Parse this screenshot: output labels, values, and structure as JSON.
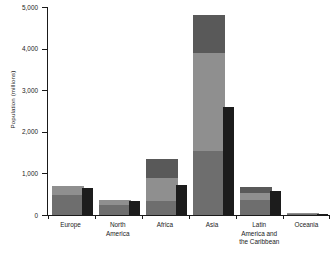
{
  "chart_data": {
    "type": "bar",
    "title": "",
    "subtitle": "",
    "xlabel": "",
    "ylabel": "Population (millions)",
    "ylim": [
      0,
      5000
    ],
    "ytick_values": [
      0,
      1000,
      2000,
      3000,
      4000,
      5000
    ],
    "ytick_labels": [
      "0",
      "1,000",
      "2,000",
      "3,000",
      "4,000",
      "5,000"
    ],
    "grid": false,
    "legend": "none",
    "categories": [
      "Europe",
      "North\nAmerica",
      "Africa",
      "Asia",
      "Latin\nAmerica and\nthe Caribbean",
      "Oceania"
    ],
    "series": [
      {
        "name": "back-bar-lower-segment",
        "color": "#6e6e6e",
        "values": [
          470,
          250,
          330,
          1530,
          370,
          30
        ]
      },
      {
        "name": "back-bar-middle-segment",
        "color": "#8f8f8f",
        "values": [
          700,
          350,
          880,
          3900,
          530,
          40
        ]
      },
      {
        "name": "back-bar-upper-segment",
        "color": "#595959",
        "values": [
          700,
          350,
          1350,
          4820,
          680,
          40
        ]
      },
      {
        "name": "front-bar",
        "color": "#1c1c1c",
        "values": [
          640,
          340,
          730,
          2600,
          580,
          35
        ]
      }
    ],
    "colors": {
      "axis": "#1a1a1a",
      "background": "#ffffff",
      "segment_lower": "#6e6e6e",
      "segment_middle": "#8f8f8f",
      "segment_upper": "#595959",
      "front_bar": "#1c1c1c"
    }
  }
}
